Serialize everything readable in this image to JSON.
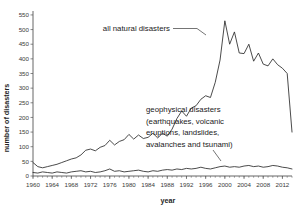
{
  "chart_data": {
    "type": "line",
    "title": "",
    "xlabel": "year",
    "ylabel": "number of disasters",
    "xlim": [
      1960,
      2014
    ],
    "ylim": [
      0,
      560
    ],
    "grid": false,
    "legend_position": "none",
    "x_ticks": [
      1960,
      1964,
      1968,
      1972,
      1976,
      1980,
      1984,
      1988,
      1992,
      1996,
      2000,
      2004,
      2008,
      2012
    ],
    "y_ticks": [
      0,
      50,
      100,
      150,
      200,
      250,
      300,
      350,
      400,
      450,
      500,
      550
    ],
    "x_minor_tick_step": 1,
    "line_color": "#2b2b2b",
    "x": [
      1960,
      1961,
      1962,
      1963,
      1964,
      1965,
      1966,
      1967,
      1968,
      1969,
      1970,
      1971,
      1972,
      1973,
      1974,
      1975,
      1976,
      1977,
      1978,
      1979,
      1980,
      1981,
      1982,
      1983,
      1984,
      1985,
      1986,
      1987,
      1988,
      1989,
      1990,
      1991,
      1992,
      1993,
      1994,
      1995,
      1996,
      1997,
      1998,
      1999,
      2000,
      2001,
      2002,
      2003,
      2004,
      2005,
      2006,
      2007,
      2008,
      2009,
      2010,
      2011,
      2012,
      2013,
      2014
    ],
    "series": [
      {
        "name": "all natural disasters",
        "annotation": "all natural disasters",
        "values": [
          46,
          32,
          28,
          32,
          36,
          40,
          46,
          52,
          58,
          62,
          72,
          88,
          92,
          86,
          98,
          104,
          122,
          106,
          118,
          124,
          142,
          126,
          140,
          128,
          132,
          146,
          130,
          146,
          136,
          160,
          196,
          222,
          204,
          232,
          240,
          262,
          274,
          268,
          320,
          396,
          530,
          450,
          492,
          420,
          418,
          450,
          392,
          420,
          382,
          376,
          400,
          380,
          368,
          350,
          150
        ]
      },
      {
        "name": "geophysical disasters",
        "annotation": "geophysical disasters\n(earthquakes, volcanic\neruptions, landslides,\navalanches and tsunami)",
        "annotation_lines": [
          "geophysical disasters",
          "(earthquakes, volcanic",
          "eruptions, landslides,",
          "avalanches and tsunami)"
        ],
        "values": [
          12,
          10,
          14,
          12,
          10,
          14,
          12,
          10,
          14,
          16,
          18,
          14,
          16,
          12,
          14,
          18,
          24,
          16,
          18,
          14,
          16,
          18,
          20,
          16,
          14,
          18,
          16,
          20,
          22,
          20,
          24,
          22,
          26,
          24,
          26,
          30,
          26,
          24,
          28,
          32,
          34,
          30,
          32,
          30,
          34,
          36,
          32,
          34,
          30,
          32,
          36,
          34,
          30,
          28,
          24
        ]
      }
    ]
  },
  "annotations": {
    "all_natural": "all natural disasters",
    "geophysical_lines": [
      "geophysical disasters",
      "(earthquakes, volcanic",
      "eruptions, landslides,",
      "avalanches and tsunami)"
    ]
  }
}
